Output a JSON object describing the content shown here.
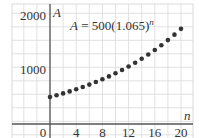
{
  "chart_data": {
    "type": "scatter",
    "title": "",
    "equation": {
      "lhs": "A",
      "equals": " = ",
      "base": "500(1.065)",
      "exponent": "n"
    },
    "xlabel": "n",
    "ylabel": "A",
    "xlim": [
      -7.5,
      20.5
    ],
    "ylim": [
      -260,
      2220
    ],
    "x_ticks": [
      0,
      4,
      8,
      12,
      16,
      20
    ],
    "x_tick_labels": [
      "0",
      "4",
      "8",
      "12",
      "16",
      "20"
    ],
    "y_ticks": [
      1000,
      2000
    ],
    "y_tick_labels": [
      "1000",
      "2000"
    ],
    "grid": true,
    "legend": null,
    "x": [
      0,
      1,
      2,
      3,
      4,
      5,
      6,
      7,
      8,
      9,
      10,
      11,
      12,
      13,
      14,
      15,
      16,
      17,
      18,
      19,
      20
    ],
    "series": [
      {
        "name": "A = 500(1.065)^n",
        "values": [
          500,
          532.5,
          567.1,
          604.0,
          643.2,
          685.0,
          729.6,
          777.0,
          827.5,
          881.3,
          938.6,
          999.6,
          1064.6,
          1133.8,
          1207.5,
          1286.0,
          1369.6,
          1458.6,
          1553.4,
          1654.4,
          1762.0
        ],
        "color": "#333333",
        "marker": "dot"
      }
    ]
  },
  "style": {
    "grid_color": "#d9d9d9",
    "axis_color": "#555555",
    "point_color": "#333333",
    "text_color": "#333333"
  }
}
